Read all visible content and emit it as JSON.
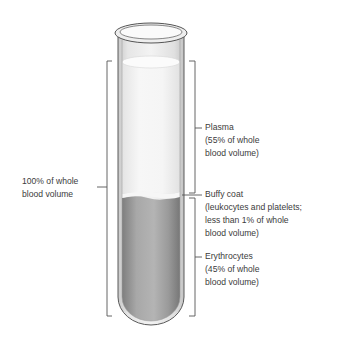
{
  "diagram": {
    "type": "centrifuged blood test tube",
    "labels": {
      "whole": {
        "line1": "100% of whole",
        "line2": "blood volume"
      },
      "plasma": {
        "title": "Plasma",
        "line1": "(55% of whole",
        "line2": "blood volume)"
      },
      "buffy": {
        "title": "Buffy coat",
        "line1": "(leukocytes and platelets;",
        "line2": "less than 1% of whole",
        "line3": "blood volume)"
      },
      "erythro": {
        "title": "Erythrocytes",
        "line1": "(45% of whole",
        "line2": "blood volume)"
      }
    },
    "layers": [
      {
        "name": "Plasma",
        "percent": 55
      },
      {
        "name": "Buffy coat",
        "percent": "<1"
      },
      {
        "name": "Erythrocytes",
        "percent": 45
      }
    ],
    "colors": {
      "plasma": "#f2f2f2",
      "erythrocytes": "#9a9a9a",
      "glass": "#dcdcdc",
      "line": "#444444"
    }
  }
}
